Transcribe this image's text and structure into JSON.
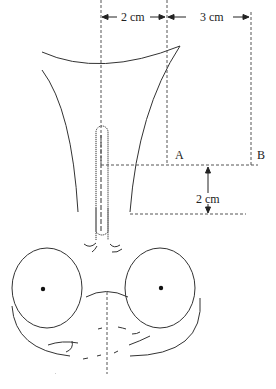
{
  "figure": {
    "type": "anatomical-measurement-diagram",
    "stroke_color": "#333333",
    "dash_color": "#555555"
  },
  "labels": {
    "top_left_dimension": "2 cm",
    "top_right_dimension": "3 cm",
    "point_a": "A",
    "point_b": "B",
    "vertical_dimension": "2 cm"
  },
  "caption": {
    "text": ""
  }
}
